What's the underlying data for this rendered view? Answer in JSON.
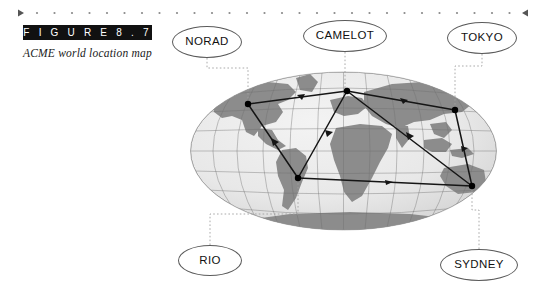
{
  "figure": {
    "label": "F I G U R E   8 . 7",
    "caption": "ACME world location map"
  },
  "top_rule": {
    "left_marker": "play-triangle-right",
    "right_marker": "play-triangle-left",
    "dot_count": 28,
    "color": "#7a7a7a"
  },
  "map": {
    "projection": "mollweide-globe",
    "ocean_color": "#e9e9e9",
    "land_color": "#8c8c8c",
    "graticule_color": "#6f6f6f",
    "link_color": "#1a1a1a",
    "leader_color": "#9a9a9a",
    "node_color": "#000000"
  },
  "callouts": [
    {
      "id": "norad",
      "label": "NORAD",
      "x": 172,
      "y": 26,
      "w": 70,
      "h": 32
    },
    {
      "id": "camelot",
      "label": "CAMELOT",
      "x": 303,
      "y": 20,
      "w": 84,
      "h": 32
    },
    {
      "id": "tokyo",
      "label": "TOKYO",
      "x": 447,
      "y": 22,
      "w": 70,
      "h": 32
    },
    {
      "id": "rio",
      "label": "RIO",
      "x": 178,
      "y": 245,
      "w": 64,
      "h": 31
    },
    {
      "id": "sydney",
      "label": "SYDNEY",
      "x": 440,
      "y": 249,
      "w": 78,
      "h": 32
    }
  ],
  "nodes": [
    {
      "id": "norad",
      "label": "NORAD",
      "x": 248,
      "y": 104
    },
    {
      "id": "camelot",
      "label": "CAMELOT",
      "x": 347,
      "y": 91
    },
    {
      "id": "tokyo",
      "label": "TOKYO",
      "x": 455,
      "y": 110
    },
    {
      "id": "rio",
      "label": "RIO",
      "x": 298,
      "y": 178
    },
    {
      "id": "sydney",
      "label": "SYDNEY",
      "x": 472,
      "y": 186
    }
  ],
  "links": [
    {
      "from": "norad",
      "to": "camelot"
    },
    {
      "from": "camelot",
      "to": "tokyo"
    },
    {
      "from": "norad",
      "to": "rio"
    },
    {
      "from": "camelot",
      "to": "rio"
    },
    {
      "from": "camelot",
      "to": "sydney"
    },
    {
      "from": "tokyo",
      "to": "sydney"
    },
    {
      "from": "rio",
      "to": "sydney"
    }
  ]
}
